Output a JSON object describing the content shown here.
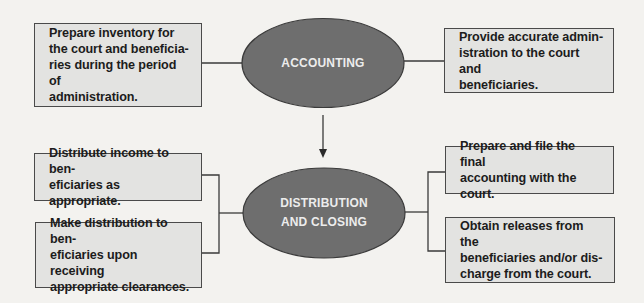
{
  "diagram": {
    "colors": {
      "background": "#f3f2ef",
      "box_fill": "#e3e3e1",
      "box_border": "#4a4a4a",
      "ellipse_fill": "#6e6e6e",
      "ellipse_border": "#3a3a3a",
      "ellipse_text": "#ececec",
      "line": "#3a3a3a"
    },
    "nodes": {
      "accounting": {
        "label": "ACCOUNTING",
        "shape": "ellipse"
      },
      "distribution_closing": {
        "label": "DISTRIBUTION\nAND CLOSING",
        "shape": "ellipse"
      }
    },
    "boxes": {
      "top_left": "Prepare inventory for\nthe court and beneficia-\nries during the period of\nadministration.",
      "top_right": "Provide accurate admin-\nistration to the court and\nbeneficiaries.",
      "mid_left": "Distribute income to ben-\neficiaries as appropriate.",
      "bottom_left": "Make distribution to ben-\neficiaries upon receiving\nappropriate clearances.",
      "mid_right": "Prepare and file the final\naccounting with the court.",
      "bottom_right": "Obtain releases from the\nbeneficiaries and/or dis-\ncharge from the court."
    },
    "edges": [
      {
        "from": "top_left",
        "to": "accounting",
        "type": "line"
      },
      {
        "from": "accounting",
        "to": "top_right",
        "type": "line"
      },
      {
        "from": "accounting",
        "to": "distribution_closing",
        "type": "arrow"
      },
      {
        "from": "mid_left",
        "to": "distribution_closing",
        "type": "bracket"
      },
      {
        "from": "bottom_left",
        "to": "distribution_closing",
        "type": "bracket"
      },
      {
        "from": "distribution_closing",
        "to": "mid_right",
        "type": "bracket"
      },
      {
        "from": "distribution_closing",
        "to": "bottom_right",
        "type": "bracket"
      }
    ]
  }
}
